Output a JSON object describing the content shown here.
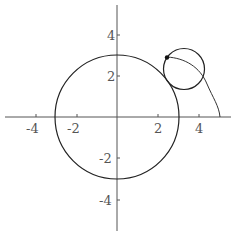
{
  "figure": {
    "type": "epicycloid-construction",
    "axes": {
      "x_ticks": [
        {
          "value": -4,
          "label": "-4"
        },
        {
          "value": -2,
          "label": "-2"
        },
        {
          "value": 2,
          "label": "2"
        },
        {
          "value": 4,
          "label": "4"
        }
      ],
      "y_ticks": [
        {
          "value": 4,
          "label": "4"
        },
        {
          "value": 2,
          "label": "2"
        },
        {
          "value": -2,
          "label": "-2"
        },
        {
          "value": -4,
          "label": "-4"
        }
      ],
      "xlim": [
        -5.6,
        5.6
      ],
      "ylim": [
        -5.6,
        5.6
      ]
    },
    "fixed_circle": {
      "cx": 0,
      "cy": 0,
      "r": 3
    },
    "rolling_circle": {
      "cx": 3.25,
      "cy": 2.35,
      "r": 1
    },
    "tracing_point": {
      "x": 2.45,
      "y": 2.93
    },
    "curve_end": {
      "x": 5,
      "y": 0
    },
    "colors": {
      "stroke": "#222222",
      "axis": "#555555",
      "label": "#555555"
    }
  }
}
